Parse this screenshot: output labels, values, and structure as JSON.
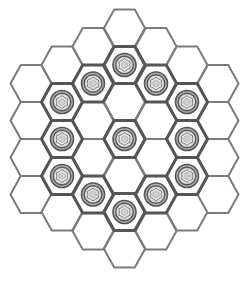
{
  "game": {
    "board_shape": "hexagon",
    "board_radius": 3,
    "cell_orientation": "flat-top",
    "colors": {
      "background": "#ffffff",
      "cell_fill": "#ffffff",
      "cell_stroke": "#7a7a7a",
      "occupied_stroke": "#555555",
      "piece_outer": "#555555",
      "piece_ring": "#b5b5b5",
      "piece_inner": "#e0e0e0",
      "piece_core": "#cfcfcf"
    },
    "columns": [
      {
        "q": -3,
        "x": 31,
        "rows": [
          83.5,
          120.5,
          157.5,
          194.5
        ]
      },
      {
        "q": -2,
        "x": 62,
        "rows": [
          65,
          102,
          139,
          176,
          212
        ]
      },
      {
        "q": -1,
        "x": 93,
        "rows": [
          46.5,
          83.5,
          120.5,
          157.5,
          194.5,
          231
        ]
      },
      {
        "q": 0,
        "x": 124.5,
        "rows": [
          28,
          65,
          102,
          139,
          176,
          212,
          249
        ]
      },
      {
        "q": 1,
        "x": 156,
        "rows": [
          46.5,
          83.5,
          120.5,
          157.5,
          194.5,
          231
        ]
      },
      {
        "q": 2,
        "x": 187,
        "rows": [
          65,
          102,
          139,
          176,
          212
        ]
      },
      {
        "q": 3,
        "x": 218,
        "rows": [
          83.5,
          120.5,
          157.5,
          194.5
        ]
      }
    ],
    "pieces": [
      {
        "x": 124.5,
        "y": 65
      },
      {
        "x": 93,
        "y": 83.5
      },
      {
        "x": 156,
        "y": 83.5
      },
      {
        "x": 62,
        "y": 102
      },
      {
        "x": 187,
        "y": 102
      },
      {
        "x": 62,
        "y": 139
      },
      {
        "x": 124.5,
        "y": 139
      },
      {
        "x": 187,
        "y": 139
      },
      {
        "x": 62,
        "y": 176
      },
      {
        "x": 187,
        "y": 176
      },
      {
        "x": 93,
        "y": 194.5
      },
      {
        "x": 156,
        "y": 194.5
      },
      {
        "x": 124.5,
        "y": 212
      }
    ],
    "piece_count": 13,
    "cell_count": 37
  }
}
